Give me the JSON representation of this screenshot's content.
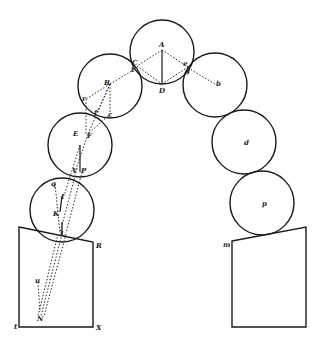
{
  "figure": {
    "title": ""
  },
  "circles": [
    {
      "id": "lower-left",
      "cx": 62,
      "cy": 210,
      "r": 32,
      "label": ""
    },
    {
      "id": "E",
      "cx": 80,
      "cy": 145,
      "r": 32,
      "label": ""
    },
    {
      "id": "B",
      "cx": 110,
      "cy": 86,
      "r": 32,
      "label": "B"
    },
    {
      "id": "A",
      "cx": 162,
      "cy": 52,
      "r": 32,
      "label": "A"
    },
    {
      "id": "b",
      "cx": 215,
      "cy": 85,
      "r": 32,
      "label": "b"
    },
    {
      "id": "d",
      "cx": 244,
      "cy": 142,
      "r": 32,
      "label": "d"
    },
    {
      "id": "p",
      "cx": 262,
      "cy": 203,
      "r": 32,
      "label": "p"
    }
  ],
  "labels": {
    "A": "A",
    "C": "C",
    "t": "t",
    "e": "e",
    "g": "g",
    "D": "D",
    "B": "B",
    "r": "r",
    "f": "f",
    "c": "c",
    "E": "E",
    "F": "F",
    "V": "V",
    "P": "P",
    "q": "q",
    "I": "I",
    "K": "K",
    "L": "L",
    "R": "R",
    "u": "u",
    "N": "N",
    "X": "X",
    "tl": "t",
    "b": "b",
    "d": "d",
    "p": "p",
    "m": "m"
  },
  "piers": {
    "left": {
      "points": "19,227 93,242 93,327 19,327",
      "corner_labels": [
        "R",
        "X"
      ]
    },
    "right": {
      "points": "232,241 306,227 306,327 232,327",
      "corner_labels": [
        "m"
      ]
    }
  }
}
